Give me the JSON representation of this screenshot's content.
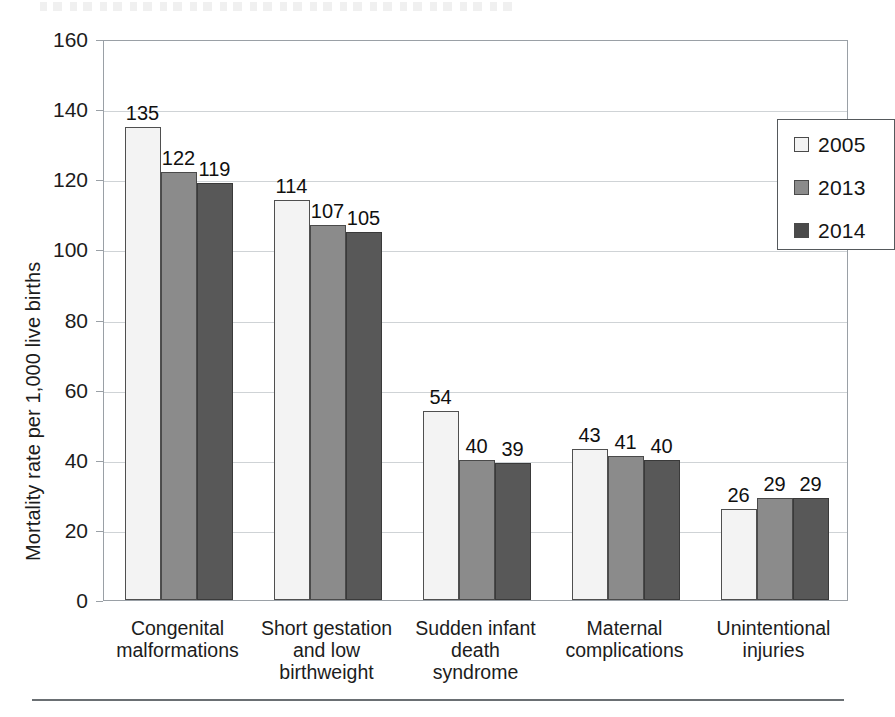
{
  "chart_data": {
    "type": "bar",
    "title": "",
    "xlabel": "",
    "ylabel": "Mortality rate per 1,000 live births",
    "ylim": [
      0,
      160
    ],
    "ytick_step": 20,
    "yticks": [
      0,
      20,
      40,
      60,
      80,
      100,
      120,
      140,
      160
    ],
    "ytick_labels": [
      "0",
      "20",
      "40",
      "60",
      "80",
      "100",
      "120",
      "140",
      "160"
    ],
    "grid": true,
    "grid_axis": "y",
    "legend_position": "top-right-inside",
    "data_labels": true,
    "categories": [
      "Congenital\nmalformations",
      "Short gestation\nand low\nbirthweight",
      "Sudden infant\ndeath\nsyndrome",
      "Maternal\ncomplications",
      "Unintentional\ninjuries"
    ],
    "series": [
      {
        "name": "2005",
        "color": "#f3f3f3",
        "values": [
          135,
          114,
          54,
          43,
          26
        ]
      },
      {
        "name": "2013",
        "color": "#8b8b8b",
        "values": [
          122,
          107,
          40,
          41,
          29
        ]
      },
      {
        "name": "2014",
        "color": "#585858",
        "values": [
          119,
          105,
          39,
          40,
          29
        ]
      }
    ]
  },
  "legend": {
    "items": [
      {
        "label": "2005",
        "swatch": "legend-swatch-2005"
      },
      {
        "label": "2013",
        "swatch": "legend-swatch-2013"
      },
      {
        "label": "2014",
        "swatch": "legend-swatch-2014"
      }
    ]
  },
  "axes": {
    "y_title": "Mortality rate per 1,000 live births"
  },
  "colors": {
    "series_2005": "#f3f3f3",
    "series_2013": "#8b8b8b",
    "series_2014": "#585858",
    "gridline": "#cfd3d6",
    "frame": "#9aa0a6",
    "text": "#1c1c1c"
  }
}
